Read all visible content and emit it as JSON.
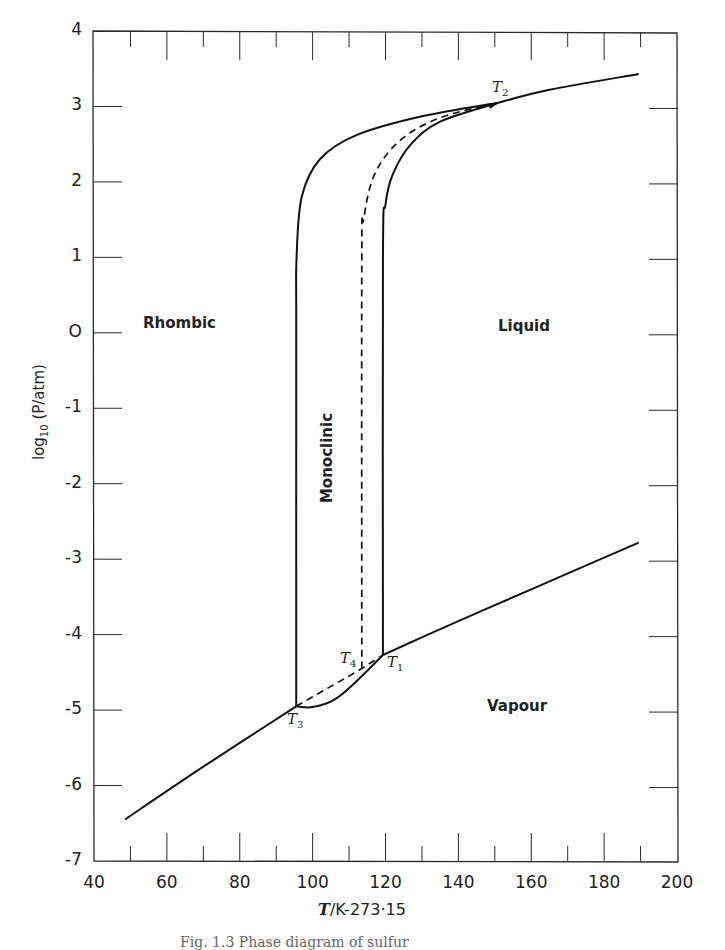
{
  "chart_data": {
    "type": "line",
    "title": "Phase diagram of sulfur",
    "xlabel": "T/K-273.15",
    "ylabel": "log10(P/atm)",
    "xlim": [
      40,
      200
    ],
    "ylim": [
      -7,
      4
    ],
    "xticks": [
      40,
      60,
      80,
      100,
      120,
      140,
      160,
      180,
      200
    ],
    "yticks": [
      4,
      3,
      2,
      1,
      0,
      -1,
      -2,
      -3,
      -4,
      -5,
      -6,
      -7
    ],
    "grid": false,
    "legend": null,
    "regions": [
      {
        "name": "Rhombic",
        "x": 58,
        "y": 0.1
      },
      {
        "name": "Monoclinic",
        "x": 104,
        "y": -1.7,
        "rotated": true
      },
      {
        "name": "Liquid",
        "x": 150,
        "y": 0.05
      },
      {
        "name": "Vapour",
        "x": 149,
        "y": -5
      }
    ],
    "points": [
      {
        "name": "T1",
        "x": 119.3,
        "y": -4.27
      },
      {
        "name": "T2",
        "x": 151.0,
        "y": 3.05
      },
      {
        "name": "T3",
        "x": 95.5,
        "y": -4.95
      },
      {
        "name": "T4",
        "x": 113.5,
        "y": -4.45
      }
    ],
    "series": [
      {
        "name": "Rhombic-Vapour",
        "style": "solid",
        "x": [
          48.5,
          70,
          95.5
        ],
        "y": [
          -6.45,
          -5.75,
          -4.95
        ]
      },
      {
        "name": "Monoclinic-Vapour",
        "style": "solid",
        "x": [
          95.5,
          100,
          106,
          112,
          119.3
        ],
        "y": [
          -4.95,
          -4.96,
          -4.86,
          -4.62,
          -4.27
        ]
      },
      {
        "name": "Liquid-Vapour (low)",
        "style": "solid",
        "x": [
          119.3,
          140,
          160,
          189.5
        ],
        "y": [
          -4.27,
          -3.82,
          -3.4,
          -2.78
        ]
      },
      {
        "name": "Rhombic-Monoclinic",
        "style": "solid",
        "x": [
          95.5,
          95.5,
          95.6,
          97,
          102,
          112,
          130,
          151
        ],
        "y": [
          -4.95,
          0.0,
          1.0,
          1.8,
          2.3,
          2.62,
          2.87,
          3.05
        ]
      },
      {
        "name": "Monoclinic-Liquid",
        "style": "solid",
        "x": [
          119.3,
          119.3,
          120,
          122,
          127,
          135,
          151
        ],
        "y": [
          -4.27,
          1.0,
          1.7,
          2.1,
          2.5,
          2.8,
          3.05
        ]
      },
      {
        "name": "Rhombic-Liquid (metastable)",
        "style": "dashed",
        "x": [
          113.5,
          113.5,
          114,
          117,
          124,
          135,
          151
        ],
        "y": [
          -4.45,
          1.0,
          1.5,
          2.1,
          2.55,
          2.85,
          3.05
        ]
      },
      {
        "name": "Rhombic-Vapour metastable",
        "style": "dashed",
        "x": [
          95.5,
          113.5,
          119.3
        ],
        "y": [
          -4.95,
          -4.45,
          -4.27
        ]
      },
      {
        "name": "Liquid-Vapour (high)",
        "style": "solid",
        "x": [
          151,
          165,
          189.5
        ],
        "y": [
          3.05,
          3.22,
          3.43
        ]
      }
    ]
  },
  "labels": {
    "y_ticks": [
      "4",
      "3",
      "2",
      "1",
      "O",
      "-1",
      "-2",
      "-3",
      "-4",
      "-5",
      "-6",
      "-7"
    ],
    "x_ticks": [
      "40",
      "60",
      "80",
      "100",
      "120",
      "140",
      "160",
      "180",
      "200"
    ],
    "y_axis_title": "log10 (P/atm)",
    "y_axis_title_main": "log",
    "y_axis_title_sub": "10",
    "y_axis_title_rest": "(P/atm)",
    "x_axis_title_var": "T",
    "x_axis_title_rest": "/K-273·15",
    "region_rhombic": "Rhombic",
    "region_monoclinic": "Monoclinic",
    "region_liquid": "Liquid",
    "region_vapour": "Vapour",
    "point_t1": "T",
    "point_t1_sub": "1",
    "point_t2": "T",
    "point_t2_sub": "2",
    "point_t3": "T",
    "point_t3_sub": "3",
    "point_t4": "T",
    "point_t4_sub": "4",
    "caption": "Fig. 1.3   Phase diagram of sulfur"
  }
}
